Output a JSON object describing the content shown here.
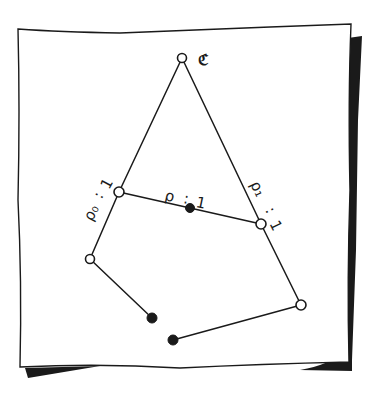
{
  "diagram": {
    "type": "hand-drawn graph on paper sheet",
    "colors": {
      "ink": "#1a1a1a",
      "paper": "#ffffff",
      "shadow": "#1a1a1a"
    },
    "labels": {
      "top": "ℭ",
      "left_edge": "ρ₀ : 1",
      "left_rho": "ρ₀",
      "left_colon": ":",
      "left_value": "1",
      "middle_edge": "ρ : 1",
      "middle_rho": "ρ",
      "middle_colon": ":",
      "middle_value": "1",
      "right_edge": "ρ₁ : 1",
      "right_rho": "ρ₁",
      "right_colon": ":",
      "right_value": "1"
    },
    "nodes": [
      {
        "id": "c-top",
        "type": "open",
        "x": 182,
        "y": 58
      },
      {
        "id": "rho0-node",
        "type": "open",
        "x": 119,
        "y": 192
      },
      {
        "id": "middle-dot",
        "type": "filled",
        "x": 190,
        "y": 208
      },
      {
        "id": "rho1-node",
        "type": "open",
        "x": 261,
        "y": 224
      },
      {
        "id": "left-lower",
        "type": "open",
        "x": 90,
        "y": 259
      },
      {
        "id": "bottom-left-dot",
        "type": "filled",
        "x": 152,
        "y": 318
      },
      {
        "id": "bottom-dot",
        "type": "filled",
        "x": 173,
        "y": 340
      },
      {
        "id": "right-lower",
        "type": "open",
        "x": 301,
        "y": 305
      }
    ],
    "edges": [
      [
        "c-top",
        "rho0-node"
      ],
      [
        "c-top",
        "rho1-node"
      ],
      [
        "rho0-node",
        "rho1-node"
      ],
      [
        "rho0-node",
        "left-lower"
      ],
      [
        "left-lower",
        "bottom-left-dot"
      ],
      [
        "rho1-node",
        "right-lower"
      ],
      [
        "right-lower",
        "bottom-dot"
      ]
    ]
  }
}
